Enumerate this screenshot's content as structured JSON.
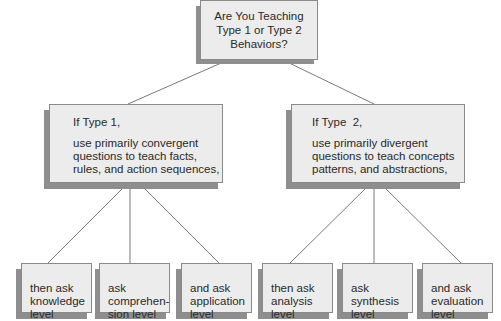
{
  "diagram": {
    "root": {
      "text": "Are You Teaching\nType 1 or Type 2\nBehaviors?"
    },
    "branches": [
      {
        "heading": "If Type 1,",
        "body": "use primarily convergent\nquestions to teach facts,\nrules, and action sequences,",
        "leaves": [
          {
            "text": "then ask\nknowledge\nlevel"
          },
          {
            "text": "ask\ncomprehen-\nsion level"
          },
          {
            "text": "and ask\napplication\nlevel"
          }
        ]
      },
      {
        "heading": "If Type  2,",
        "body": "use primarily divergent\nquestions to teach concepts\npatterns, and abstractions,",
        "leaves": [
          {
            "text": "then ask\nanalysis\nlevel"
          },
          {
            "text": "ask\nsynthesis\nlevel"
          },
          {
            "text": "and ask\nevaluation\nlevel"
          }
        ]
      }
    ],
    "colors": {
      "box_fill": "#ececec",
      "box_border": "#8a8a8a",
      "shadow": "#8e8e8e",
      "connector": "#555555"
    }
  }
}
